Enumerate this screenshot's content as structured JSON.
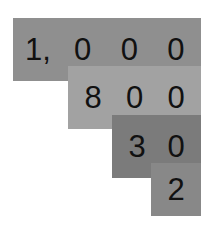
{
  "rows": [
    {
      "label": "1,000",
      "digits": [
        "1,",
        "0",
        "0",
        "0"
      ],
      "color": "#8f8f8f"
    },
    {
      "label": "800",
      "digits": [
        "8",
        "0",
        "0"
      ],
      "color": "#a2a2a2"
    },
    {
      "label": "30",
      "digits": [
        "3",
        "0"
      ],
      "color": "#7b7b7b"
    },
    {
      "label": "2",
      "digits": [
        "2"
      ],
      "color": "#888888"
    }
  ]
}
